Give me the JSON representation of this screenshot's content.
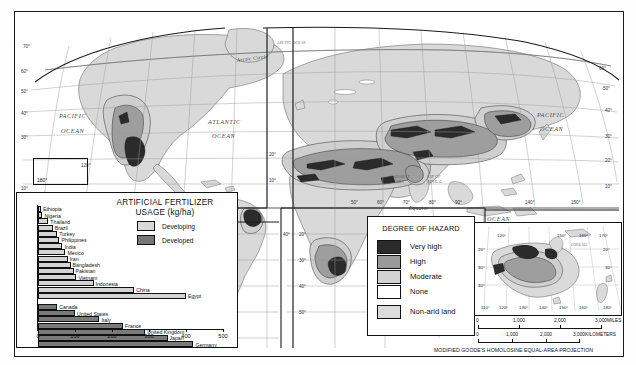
{
  "map": {
    "title": "Desertification Hazard World Map",
    "projection_note": "MODIFIED GOODE'S HOMOLOSINE EQUAL-AREA PROJECTION",
    "ocean_labels": [
      {
        "text": "PACIFIC",
        "x": 44,
        "y": 104
      },
      {
        "text": "OCEAN",
        "x": 46,
        "y": 119
      },
      {
        "text": "ATLANTIC",
        "x": 193,
        "y": 110
      },
      {
        "text": "OCEAN",
        "x": 197,
        "y": 124
      },
      {
        "text": "ARCTIC OCEAN",
        "x": 268,
        "y": 35
      },
      {
        "text": "PACIFIC",
        "x": 522,
        "y": 103
      },
      {
        "text": "OCEAN",
        "x": 525,
        "y": 117
      },
      {
        "text": "INDIAN",
        "x": 446,
        "y": 207
      },
      {
        "text": "OCEAN",
        "x": 482,
        "y": 207
      }
    ],
    "sea_labels": [
      {
        "text": "ARABIAN",
        "x": 383,
        "y": 166
      },
      {
        "text": "SEA",
        "x": 386,
        "y": 171
      },
      {
        "text": "BAY OF",
        "x": 417,
        "y": 166
      },
      {
        "text": "BENGAL",
        "x": 417,
        "y": 171
      }
    ],
    "line_labels": [
      {
        "text": "Arctic Circle",
        "x": 239,
        "y": 50
      },
      {
        "text": "Equator",
        "x": 408,
        "y": 199
      }
    ],
    "left_lat_labels": [
      "70°",
      "60°",
      "50°",
      "40°",
      "30°",
      "10°"
    ],
    "right_lat_labels": [
      "60°",
      "50°",
      "40°",
      "30°",
      "20°",
      "10°"
    ],
    "lon_box_label": "180°",
    "bottom_lon_labels": [
      "50°",
      "60°",
      "70°",
      "80°",
      "90°",
      "140°",
      "150°"
    ],
    "mid_lat_labels": [
      "20°",
      "10°",
      "20°",
      "30°",
      "40°",
      "50°"
    ]
  },
  "chart_data": {
    "type": "bar",
    "title": "ARTIFICIAL FERTILIZER USAGE (kg/ha)",
    "title_line1": "ARTIFICIAL FERTILIZER",
    "title_line2": "USAGE (kg/ha)",
    "xlabel": "",
    "ylabel": "",
    "xlim": [
      0,
      500
    ],
    "xticks": [
      0,
      100,
      200,
      300,
      400,
      500
    ],
    "grid": false,
    "legend_position": "top-right",
    "legend": [
      {
        "name": "Developing",
        "color": "#d4d4d4"
      },
      {
        "name": "Developed",
        "color": "#7a7a7a"
      }
    ],
    "series": [
      {
        "name": "Developing",
        "color": "#d4d4d4",
        "categories": [
          "Ethiopia",
          "Nigeria",
          "Thailand",
          "Brazil",
          "Turkey",
          "Philippines",
          "India",
          "Mexico",
          "Iran",
          "Bangladesh",
          "Pakistan",
          "Vietnam",
          "Indonesia",
          "China",
          "Egypt"
        ],
        "values": [
          8,
          12,
          28,
          40,
          52,
          58,
          66,
          74,
          80,
          88,
          96,
          104,
          150,
          260,
          400
        ]
      },
      {
        "name": "Developed",
        "color": "#7a7a7a",
        "categories": [
          "Canada",
          "United States",
          "Italy",
          "France",
          "United Kingdom",
          "Japan",
          "Germany"
        ],
        "values": [
          52,
          100,
          166,
          230,
          290,
          350,
          420
        ]
      }
    ]
  },
  "legend": {
    "title": "DEGREE OF HAZARD",
    "items": [
      {
        "label": "Very high",
        "color": "#2b2b2b"
      },
      {
        "label": "High",
        "color": "#9a9a9a"
      },
      {
        "label": "Moderate",
        "color": "#d2d2d2"
      },
      {
        "label": "None",
        "color": "#ffffff"
      },
      {
        "label": "Non-arid land",
        "color": "#dcdcdc"
      }
    ]
  },
  "inset": {
    "name": "australia-inset",
    "sea_label": "CORAL SEA",
    "top_lon_labels": [
      "120°",
      "150°",
      "160°",
      "170°"
    ],
    "bottom_lon_labels": [
      "110°",
      "120°",
      "130°",
      "140°",
      "150°",
      "160°",
      "180°"
    ],
    "left_lat_labels": [
      "20°",
      "30°",
      "40°"
    ],
    "right_lat_labels": [
      "20°",
      "30°"
    ]
  },
  "scales": {
    "miles": {
      "ticks": [
        "0",
        "1,000",
        "2,000",
        "3,000"
      ],
      "unit": "MILES"
    },
    "kilometers": {
      "ticks": [
        "0",
        "1,000",
        "2,000",
        "3,000"
      ],
      "unit": "KILOMETERS"
    }
  }
}
